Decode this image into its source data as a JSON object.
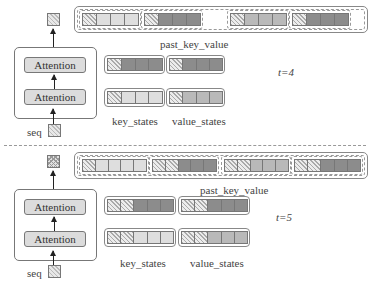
{
  "sections": [
    {
      "time_label": "t=4",
      "attention_blocks": [
        "Attention",
        "Attention"
      ],
      "input_label": "seq",
      "past_key_value": {
        "label": "past_key_value",
        "groups": [
          [
            "hatch",
            "light",
            "light",
            "light"
          ],
          [
            "hatch",
            "dark",
            "dark",
            "dark"
          ],
          [
            "hatch",
            "mid",
            "mid",
            "mid"
          ],
          [
            "hatch",
            "dark",
            "dark",
            "dark"
          ]
        ]
      },
      "key_states": {
        "label": "key_states",
        "rows": [
          [
            "hatch",
            "dark",
            "dark",
            "dark"
          ],
          [
            "hatch",
            "light",
            "light",
            "light"
          ]
        ]
      },
      "value_states": {
        "label": "value_states",
        "rows": [
          [
            "hatch",
            "dark",
            "dark",
            "dark"
          ],
          [
            "hatch",
            "mid",
            "mid",
            "mid"
          ]
        ]
      }
    },
    {
      "time_label": "t=5",
      "attention_blocks": [
        "Attention",
        "Attention"
      ],
      "input_label": "seq",
      "past_key_value": {
        "label": "past_key_value",
        "groups": [
          [
            "hatch",
            "light",
            "light",
            "light",
            "light"
          ],
          [
            "hatch",
            "hatch",
            "dark",
            "dark",
            "dark"
          ],
          [
            "hatch",
            "hatch",
            "mid",
            "mid",
            "mid"
          ],
          [
            "hatch",
            "hatch",
            "dark",
            "dark",
            "dark"
          ]
        ]
      },
      "key_states": {
        "label": "key_states",
        "rows": [
          [
            "hatch",
            "hatch",
            "dark",
            "dark",
            "dark"
          ],
          [
            "hatch",
            "hatch",
            "light",
            "light",
            "light"
          ]
        ]
      },
      "value_states": {
        "label": "value_states",
        "rows": [
          [
            "hatch",
            "hatch",
            "dark",
            "dark",
            "dark"
          ],
          [
            "hatch",
            "hatch",
            "mid",
            "mid",
            "mid"
          ]
        ]
      }
    }
  ],
  "colors": {
    "light": "#dedede",
    "mid": "#b9b9b9",
    "dark": "#8c8c8c",
    "border": "#777777"
  }
}
